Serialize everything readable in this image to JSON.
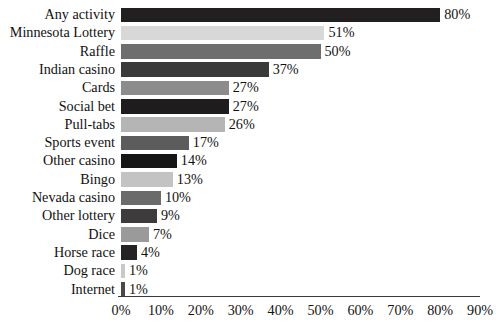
{
  "chart_data": {
    "type": "bar",
    "orientation": "horizontal",
    "title": "",
    "xlabel": "",
    "ylabel": "",
    "xlim": [
      0,
      90
    ],
    "grid": false,
    "legend": null,
    "value_suffix": "%",
    "axis_ticks": [
      "0%",
      "10%",
      "20%",
      "30%",
      "40%",
      "50%",
      "60%",
      "70%",
      "80%",
      "90%"
    ],
    "axis_tick_values": [
      0,
      10,
      20,
      30,
      40,
      50,
      60,
      70,
      80,
      90
    ],
    "categories": [
      "Any activity",
      "Minnesota Lottery",
      "Raffle",
      "Indian casino",
      "Cards",
      "Social bet",
      "Pull-tabs",
      "Sports event",
      "Other casino",
      "Bingo",
      "Nevada casino",
      "Other lottery",
      "Dice",
      "Horse race",
      "Dog race",
      "Internet"
    ],
    "values": [
      80,
      51,
      50,
      37,
      27,
      27,
      26,
      17,
      14,
      13,
      10,
      9,
      7,
      4,
      1,
      1
    ],
    "labels": [
      "80%",
      "51%",
      "50%",
      "37%",
      "27%",
      "27%",
      "26%",
      "17%",
      "14%",
      "13%",
      "10%",
      "9%",
      "7%",
      "4%",
      "1%",
      "1%"
    ],
    "bar_colors": [
      "#211f1f",
      "#d8d8d8",
      "#6e6e6e",
      "#3a3a3a",
      "#8c8c8c",
      "#1e1c1c",
      "#b5b5b5",
      "#5c5c5c",
      "#171616",
      "#c3c3c3",
      "#6b6b6b",
      "#3d3b3b",
      "#9a9a9a",
      "#242222",
      "#c9c9c9",
      "#4a4848"
    ]
  },
  "axis": {
    "line_color": "#3a3a3a"
  },
  "title_remnant": "....   .   .      ."
}
